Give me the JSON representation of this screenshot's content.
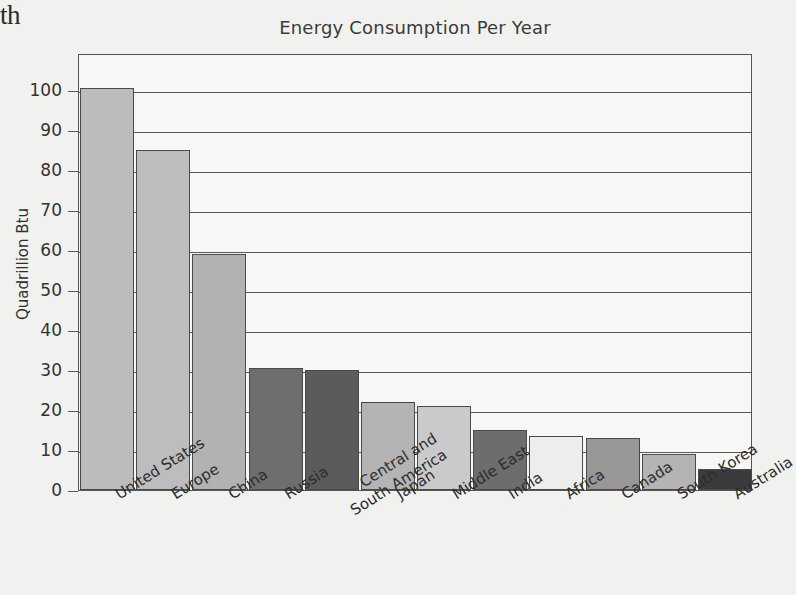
{
  "page_fragment": "th",
  "chart_data": {
    "type": "bar",
    "title": "Energy Consumption Per Year",
    "xlabel": "",
    "ylabel": "Quadrillion Btu",
    "ylim": [
      0,
      105
    ],
    "ytick_values": [
      0,
      10,
      20,
      30,
      40,
      50,
      60,
      70,
      80,
      90,
      100
    ],
    "ytick_labels": [
      "0",
      "10",
      "20",
      "30",
      "40",
      "50",
      "60",
      "70",
      "80",
      "90",
      "100"
    ],
    "grid": true,
    "legend": "none",
    "categories": [
      "United States",
      "Europe",
      "China",
      "Russia",
      "Central and South America",
      "Japan",
      "Middle East",
      "India",
      "Africa",
      "Canada",
      "South Korea",
      "Australia"
    ],
    "category_lines": [
      [
        "United States"
      ],
      [
        "Europe"
      ],
      [
        "China"
      ],
      [
        "Russia"
      ],
      [
        "Central and",
        "South America"
      ],
      [
        "Japan"
      ],
      [
        "Middle East"
      ],
      [
        "India"
      ],
      [
        "Africa"
      ],
      [
        "Canada"
      ],
      [
        "South Korea"
      ],
      [
        "Australia"
      ]
    ],
    "values": [
      100.5,
      85.0,
      59.0,
      30.5,
      30.0,
      22.0,
      21.0,
      15.0,
      13.5,
      13.0,
      9.0,
      5.3
    ],
    "bar_colors": [
      "#bcbcbc",
      "#bdbdbd",
      "#b2b2b2",
      "#6e6e6e",
      "#5b5b5b",
      "#b4b4b4",
      "#cacaca",
      "#6d6d6d",
      "#ededed",
      "#979797",
      "#b4b4b4",
      "#3b3b3b"
    ]
  },
  "style": {
    "plot_background": "#f7f7f5",
    "page_background": "#f1f1ef",
    "axis_color": "#555555",
    "grid_color": "#585858",
    "text_color": "#2f2f2f",
    "title_color": "#3b3b3b"
  }
}
